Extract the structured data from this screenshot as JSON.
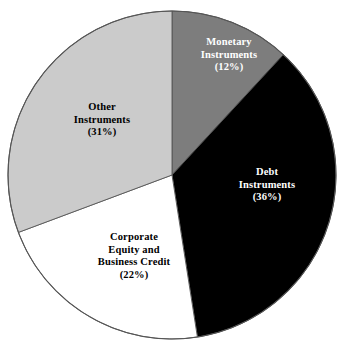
{
  "chart_data": {
    "type": "pie",
    "title": "",
    "subtitle": "",
    "xlabel": "",
    "ylabel": "",
    "legend_position": "none",
    "grid": false,
    "start_angle_deg": 0,
    "direction": "clockwise",
    "categories": [
      "Monetary Instruments",
      "Debt Instruments",
      "Corporate Equity and Business Credit",
      "Other Instruments"
    ],
    "values": [
      12,
      36,
      22,
      31
    ],
    "value_unit": "%",
    "slices": [
      {
        "name": "Monetary Instruments",
        "value": 12,
        "percent_label": "(12%)",
        "label_lines": [
          "Monetary",
          "Instruments",
          "(12%)"
        ],
        "color": "#7d7d7d",
        "text_color": "#ffffff"
      },
      {
        "name": "Debt Instruments",
        "value": 36,
        "percent_label": "(36%)",
        "label_lines": [
          "Debt",
          "Instruments",
          "(36%)"
        ],
        "color": "#000000",
        "text_color": "#ffffff"
      },
      {
        "name": "Corporate Equity and Business Credit",
        "value": 22,
        "percent_label": "(22%)",
        "label_lines": [
          "Corporate",
          "Equity and",
          "Business Credit",
          "(22%)"
        ],
        "color": "#ffffff",
        "text_color": "#000000"
      },
      {
        "name": "Other Instruments",
        "value": 31,
        "percent_label": "(31%)",
        "label_lines": [
          "Other",
          "Instruments",
          "(31%)"
        ],
        "color": "#cbcbcb",
        "text_color": "#000000"
      }
    ],
    "outline_color": "#555555"
  },
  "labels": {
    "monetary": {
      "line1": "Monetary",
      "line2": "Instruments",
      "line3": "(12%)"
    },
    "debt": {
      "line1": "Debt",
      "line2": "Instruments",
      "line3": "(36%)"
    },
    "corporate": {
      "line1": "Corporate",
      "line2": "Equity and",
      "line3": "Business Credit",
      "line4": "(22%)"
    },
    "other": {
      "line1": "Other",
      "line2": "Instruments",
      "line3": "(31%)"
    }
  }
}
